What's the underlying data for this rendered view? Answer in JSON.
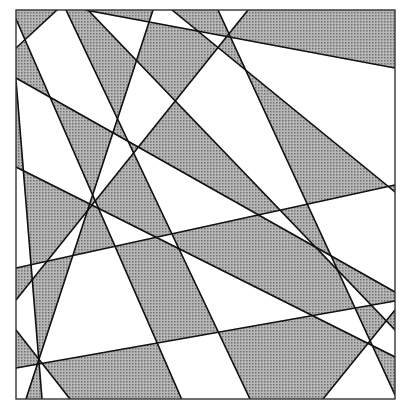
{
  "diagram": {
    "type": "line-arrangement-two-coloring",
    "frame": {
      "x1": 16,
      "y1": 10,
      "x2": 395,
      "y2": 399
    },
    "colors": {
      "background": "#ffffff",
      "shade": "#b8b8b8",
      "shade_dot": "#6e6e6e",
      "line": "#111111",
      "frame": "#333333"
    },
    "line_width": 1.6,
    "parity_reference": {
      "x": 22,
      "y": 14,
      "shaded": true
    },
    "lines": [
      {
        "id": "L1",
        "p1": [
          16,
          19
        ],
        "p2": [
          182,
          400
        ]
      },
      {
        "id": "L2",
        "p1": [
          16,
          48
        ],
        "p2": [
          57,
          10
        ]
      },
      {
        "id": "L3",
        "p1": [
          16,
          78
        ],
        "p2": [
          395,
          292
        ]
      },
      {
        "id": "L4",
        "p1": [
          66,
          10
        ],
        "p2": [
          250,
          399
        ]
      },
      {
        "id": "L5",
        "p1": [
          88,
          10
        ],
        "p2": [
          395,
          330
        ]
      },
      {
        "id": "L6",
        "p1": [
          172,
          10
        ],
        "p2": [
          395,
          192
        ]
      },
      {
        "id": "L7",
        "p1": [
          153,
          10
        ],
        "p2": [
          26,
          399
        ]
      },
      {
        "id": "L8",
        "p1": [
          248,
          10
        ],
        "p2": [
          16,
          300
        ]
      },
      {
        "id": "L9",
        "p1": [
          16,
          268
        ],
        "p2": [
          395,
          185
        ]
      },
      {
        "id": "L10",
        "p1": [
          16,
          368
        ],
        "p2": [
          395,
          301
        ]
      },
      {
        "id": "L11",
        "p1": [
          16,
          167
        ],
        "p2": [
          395,
          357
        ]
      },
      {
        "id": "L12",
        "p1": [
          16,
          80
        ],
        "p2": [
          42,
          399
        ]
      },
      {
        "id": "L13",
        "p1": [
          323,
          399
        ],
        "p2": [
          395,
          310
        ]
      },
      {
        "id": "L14",
        "p1": [
          218,
          10
        ],
        "p2": [
          395,
          395
        ]
      },
      {
        "id": "L15",
        "p1": [
          85,
          10
        ],
        "p2": [
          395,
          68
        ]
      },
      {
        "id": "L16",
        "p1": [
          16,
          330
        ],
        "p2": [
          70,
          399
        ]
      }
    ]
  }
}
